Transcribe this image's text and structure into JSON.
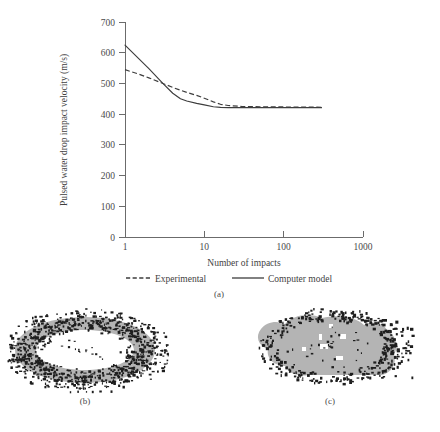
{
  "figure": {
    "panels": [
      {
        "id": "a",
        "caption": "(a)",
        "kind": "line-chart"
      },
      {
        "id": "b",
        "caption": "(b)",
        "kind": "erosion-micrograph"
      },
      {
        "id": "c",
        "caption": "(c)",
        "kind": "erosion-micrograph"
      }
    ]
  },
  "chart_data": {
    "type": "line",
    "title": "",
    "xlabel": "Number of impacts",
    "ylabel": "Pulsed water drop impact velocity (m/s)",
    "xscale": "log",
    "xlim": [
      1,
      1000
    ],
    "ylim": [
      0,
      700
    ],
    "xticks": [
      1,
      10,
      100,
      1000
    ],
    "xticklabels": [
      "1",
      "10",
      "100",
      "1000"
    ],
    "yticks": [
      0,
      100,
      200,
      300,
      400,
      500,
      600,
      700
    ],
    "yticklabels": [
      "0",
      "100",
      "200",
      "300",
      "400",
      "500",
      "600",
      "700"
    ],
    "grid": false,
    "legend_position": "below-axis",
    "series": [
      {
        "name": "Experimental",
        "style": "dashed",
        "color": "#3d3d3d",
        "x": [
          1,
          1.5,
          2,
          3,
          4,
          5,
          6,
          8,
          10,
          13,
          16,
          20,
          30,
          50,
          80,
          120,
          180,
          250,
          300
        ],
        "values": [
          545,
          530,
          518,
          500,
          487,
          478,
          471,
          461,
          452,
          440,
          432,
          428,
          425,
          424,
          424,
          423,
          423,
          423,
          422
        ]
      },
      {
        "name": "Computer model",
        "style": "solid",
        "color": "#3d3d3d",
        "x": [
          1,
          1.5,
          2,
          3,
          4,
          5,
          6,
          8,
          10,
          13,
          16,
          20,
          30,
          50,
          80,
          120,
          180,
          250,
          300
        ],
        "values": [
          625,
          580,
          548,
          500,
          468,
          450,
          443,
          435,
          430,
          424,
          422,
          421,
          421,
          421,
          421,
          421,
          421,
          421,
          421
        ]
      }
    ],
    "legend": [
      {
        "label": "Experimental",
        "style": "dashed"
      },
      {
        "label": "Computer model",
        "style": "solid"
      }
    ]
  },
  "micrographs": {
    "b": {
      "pattern": "annular-ring",
      "description": "ring-shaped erosion scar with undamaged centre",
      "fill_color": "#b4b4b4",
      "speck_color": "#1e1e1e"
    },
    "c": {
      "pattern": "filled-blob",
      "description": "fully eroded central region",
      "fill_color": "#b4b4b4",
      "speck_color": "#1e1e1e"
    }
  }
}
